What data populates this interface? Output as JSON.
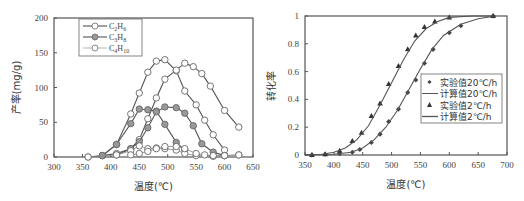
{
  "chart_data": [
    {
      "type": "line",
      "title": "",
      "xlabel": "温度(℃)",
      "ylabel": "产率(mg/g)",
      "xlim": [
        300,
        650
      ],
      "ylim": [
        0,
        200
      ],
      "xticks": [
        300,
        350,
        400,
        450,
        500,
        550,
        600,
        650
      ],
      "yticks": [
        0,
        50,
        100,
        150,
        200
      ],
      "grid": false,
      "legend_position": "upper-left",
      "legend": [
        "C2H6",
        "C3H8",
        "C4H10"
      ],
      "series": [
        {
          "name": "C2H6",
          "marker": "open-circle",
          "line": "solid",
          "x": [
            360,
            385,
            410,
            435,
            450,
            465,
            480,
            495,
            515,
            530,
            550,
            565,
            580,
            600
          ],
          "values": [
            0,
            2,
            18,
            62,
            92,
            122,
            138,
            140,
            124,
            95,
            75,
            53,
            32,
            10
          ]
        },
        {
          "name": "C2H6",
          "marker": "open-circle",
          "line": "solid",
          "x": [
            385,
            410,
            435,
            450,
            465,
            480,
            495,
            515,
            530,
            545,
            560,
            575,
            600,
            625
          ],
          "values": [
            2,
            5,
            12,
            25,
            55,
            85,
            112,
            125,
            135,
            130,
            120,
            102,
            67,
            43
          ]
        },
        {
          "name": "C3H8",
          "marker": "filled-circle",
          "line": "solid",
          "x": [
            385,
            410,
            435,
            450,
            465,
            480,
            495,
            515,
            530
          ],
          "values": [
            2,
            18,
            48,
            69,
            68,
            66,
            47,
            21,
            10
          ]
        },
        {
          "name": "C3H8",
          "marker": "filled-circle",
          "line": "solid",
          "x": [
            410,
            435,
            450,
            465,
            480,
            495,
            515,
            530,
            545,
            560,
            580,
            600
          ],
          "values": [
            3,
            12,
            22,
            42,
            65,
            72,
            71,
            63,
            45,
            19,
            7,
            2
          ]
        },
        {
          "name": "C4H10",
          "marker": "open-circle",
          "line": "thin",
          "x": [
            360,
            410,
            435,
            450,
            465,
            480,
            495,
            515,
            530,
            550,
            580,
            600,
            625
          ],
          "values": [
            0,
            3,
            9,
            16,
            12,
            13,
            12,
            10,
            5,
            2,
            1,
            2,
            3
          ]
        },
        {
          "name": "C4H10",
          "marker": "open-circle",
          "line": "thin",
          "x": [
            435,
            450,
            465,
            480,
            495,
            515,
            530,
            550,
            565,
            580,
            600,
            625
          ],
          "values": [
            3,
            5,
            8,
            12,
            15,
            15,
            12,
            5,
            3,
            2,
            2,
            3
          ]
        }
      ]
    },
    {
      "type": "line",
      "title": "",
      "xlabel": "温度(℃)",
      "ylabel": "转化率",
      "xlim": [
        350,
        700
      ],
      "ylim": [
        0,
        1
      ],
      "xticks": [
        350,
        400,
        450,
        500,
        550,
        600,
        650,
        700
      ],
      "yticks": [
        0,
        0.2,
        0.4,
        0.6,
        0.8,
        1
      ],
      "grid": false,
      "legend_position": "center-right",
      "legend": [
        "实验值20℃/h",
        "计算值20℃/h",
        "实验值2℃/h",
        "计算值2℃/h"
      ],
      "series": [
        {
          "name": "实验值20℃/h",
          "marker": "diamond",
          "line": "none",
          "x": [
            362,
            385,
            410,
            432,
            445,
            465,
            480,
            495,
            512,
            528,
            542,
            557,
            572,
            600,
            620,
            676
          ],
          "values": [
            0,
            0.005,
            0.01,
            0.02,
            0.04,
            0.09,
            0.15,
            0.24,
            0.33,
            0.45,
            0.54,
            0.66,
            0.76,
            0.88,
            0.93,
            1.0
          ]
        },
        {
          "name": "计算值20℃/h",
          "marker": "none",
          "line": "solid",
          "x": [
            350,
            400,
            430,
            450,
            470,
            490,
            510,
            530,
            550,
            570,
            590,
            620,
            650,
            680
          ],
          "values": [
            0,
            0.005,
            0.02,
            0.05,
            0.11,
            0.2,
            0.32,
            0.47,
            0.62,
            0.76,
            0.86,
            0.94,
            0.98,
            1.0
          ]
        },
        {
          "name": "实验值2℃/h",
          "marker": "triangle",
          "line": "none",
          "x": [
            362,
            385,
            410,
            432,
            448,
            465,
            480,
            495,
            512,
            528,
            542,
            557,
            575,
            600,
            676
          ],
          "values": [
            0,
            0.005,
            0.03,
            0.1,
            0.16,
            0.28,
            0.37,
            0.51,
            0.64,
            0.76,
            0.86,
            0.92,
            0.96,
            0.99,
            1.0
          ]
        },
        {
          "name": "计算值2℃/h",
          "marker": "none",
          "line": "solid",
          "x": [
            350,
            380,
            400,
            420,
            440,
            460,
            480,
            500,
            520,
            540,
            560,
            580,
            600,
            640,
            680
          ],
          "values": [
            0,
            0.005,
            0.02,
            0.05,
            0.11,
            0.21,
            0.36,
            0.52,
            0.68,
            0.82,
            0.91,
            0.96,
            0.99,
            1.0,
            1.0
          ]
        }
      ]
    }
  ],
  "left_chart": {
    "ylabel": "产率(mg/g)",
    "xlabel": "温度(℃)",
    "legend": [
      {
        "label": "C2H6",
        "base": "C",
        "sub1": "2",
        "mid": "H",
        "sub2": "6"
      },
      {
        "label": "C3H8",
        "base": "C",
        "sub1": "3",
        "mid": "H",
        "sub2": "8"
      },
      {
        "label": "C4H10",
        "base": "C",
        "sub1": "4",
        "mid": "H",
        "sub2": "10"
      }
    ]
  },
  "right_chart": {
    "ylabel": "转化率",
    "xlabel": "温度(℃)",
    "legend": [
      "实验值20℃/h",
      "计算值20℃/h",
      "实验值2℃/h",
      "计算值2℃/h"
    ]
  }
}
